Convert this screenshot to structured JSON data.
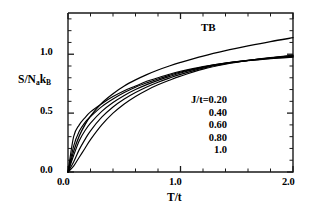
{
  "figure": {
    "width": 317,
    "height": 215,
    "background": "#ffffff",
    "ink_color": "#000000"
  },
  "axes": {
    "x_title": "T/t",
    "y_title_main": "S/N",
    "y_title_sub1": "a",
    "y_title_mid": "k",
    "y_title_sub2": "B",
    "y_title_plain": "S/N_a k_B",
    "x_tick_labels": [
      "0.0",
      "1.0",
      "2.0"
    ],
    "y_tick_labels": [
      "0.0",
      "0.5",
      "1.0"
    ]
  },
  "annotations": {
    "tb_label": "TB",
    "legend_lines": [
      "J/t=0.20",
      "0.40",
      "0.60",
      "0.80",
      "1.0"
    ]
  },
  "chart_data": {
    "type": "line",
    "title": "",
    "xlabel": "T/t",
    "ylabel": "S/N_a k_B",
    "xlim": [
      0.0,
      2.0
    ],
    "ylim": [
      0.0,
      1.35
    ],
    "x_major_ticks": [
      0.0,
      1.0,
      2.0
    ],
    "x_minor_tick_step": 0.2,
    "y_major_ticks": [
      0.0,
      0.5,
      1.0
    ],
    "y_minor_tick_step": 0.1,
    "grid": false,
    "legend_position": "inside-center-right",
    "x": [
      0.0,
      0.05,
      0.1,
      0.15,
      0.2,
      0.3,
      0.4,
      0.5,
      0.6,
      0.7,
      0.8,
      0.9,
      1.0,
      1.2,
      1.4,
      1.6,
      1.8,
      2.0
    ],
    "series": [
      {
        "name": "J/t=0.20",
        "label": "J/t=0.20",
        "values": [
          0.0,
          0.3,
          0.4,
          0.46,
          0.51,
          0.58,
          0.64,
          0.69,
          0.73,
          0.77,
          0.8,
          0.83,
          0.855,
          0.895,
          0.925,
          0.945,
          0.962,
          0.975
        ]
      },
      {
        "name": "J/t=0.40",
        "label": "0.40",
        "values": [
          0.0,
          0.22,
          0.345,
          0.42,
          0.47,
          0.555,
          0.62,
          0.675,
          0.72,
          0.757,
          0.79,
          0.82,
          0.848,
          0.892,
          0.924,
          0.947,
          0.965,
          0.98
        ]
      },
      {
        "name": "J/t=0.60",
        "label": "0.60",
        "values": [
          0.0,
          0.14,
          0.265,
          0.35,
          0.415,
          0.515,
          0.59,
          0.65,
          0.7,
          0.742,
          0.778,
          0.81,
          0.84,
          0.888,
          0.923,
          0.948,
          0.968,
          0.984
        ]
      },
      {
        "name": "J/t=0.80",
        "label": "0.80",
        "values": [
          0.0,
          0.085,
          0.19,
          0.275,
          0.35,
          0.465,
          0.552,
          0.62,
          0.675,
          0.722,
          0.762,
          0.797,
          0.829,
          0.882,
          0.92,
          0.948,
          0.97,
          0.988
        ]
      },
      {
        "name": "J/t=1.0",
        "label": "1.0",
        "values": [
          0.0,
          0.05,
          0.125,
          0.2,
          0.275,
          0.4,
          0.5,
          0.578,
          0.642,
          0.695,
          0.74,
          0.779,
          0.814,
          0.873,
          0.915,
          0.947,
          0.972,
          0.993
        ]
      },
      {
        "name": "TB",
        "label": "TB",
        "values": [
          0.0,
          0.175,
          0.305,
          0.4,
          0.475,
          0.585,
          0.665,
          0.73,
          0.782,
          0.827,
          0.866,
          0.9,
          0.93,
          0.984,
          1.03,
          1.07,
          1.107,
          1.14
        ]
      }
    ]
  }
}
